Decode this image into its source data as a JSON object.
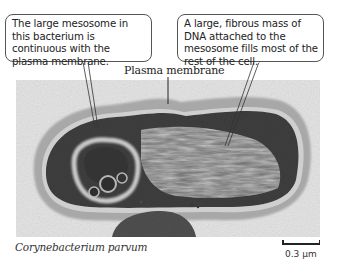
{
  "callouts": {
    "mesosome": "The large mesosome in this bacterium is continuous with the plasma membrane.",
    "dna": "A large, fibrous mass of DNA attached to the mesosome fills most of the rest of the cell."
  },
  "labels": {
    "plasma_membrane": "Plasma membrane"
  },
  "caption": {
    "species": "Corynebacterium parvum"
  },
  "scale_bar": {
    "label": "0.3 µm"
  },
  "colors": {
    "background": "#ffffff",
    "micrograph_bg": "#e4e4e4",
    "cell_wall": "#9a9a9a",
    "cytoplasm": "#3e3e3e",
    "outline": "#555555"
  }
}
